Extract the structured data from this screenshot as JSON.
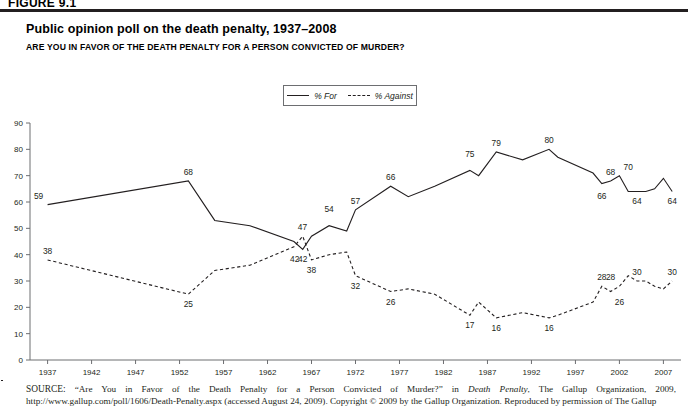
{
  "figure": {
    "label": "FIGURE 9.1",
    "title": "Public opinion poll on the death penalty, 1937–2008",
    "subtitle": "ARE YOU IN FAVOR OF THE DEATH PENALTY FOR A PERSON CONVICTED OF MURDER?"
  },
  "legend": {
    "for_label": "% For",
    "against_label": "% Against",
    "for_style": "solid-line",
    "against_style": "dashed-line"
  },
  "source": {
    "kicker": "SOURCE:",
    "text_part1": " “Are You in Favor of the Death Penalty for a Person Convicted of Murder?” in ",
    "italic1": "Death Penalty",
    "text_part2": ", The Gallup Organization, 2009, http://www.gallup.com/poll/1606/Death-Penalty.aspx (accessed August 24, 2009). Copyright © 2009 by the Gallup Organization. Reproduced by permission of The Gallup"
  },
  "colors": {
    "ink": "#231f20",
    "axis": "#6d6e71",
    "background": "#ffffff"
  },
  "chart_data": {
    "type": "line",
    "title": "Public opinion poll on the death penalty, 1937–2008",
    "subtitle": "ARE YOU IN FAVOR OF THE DEATH PENALTY FOR A PERSON CONVICTED OF MURDER?",
    "xlabel": "",
    "ylabel": "",
    "xlim": [
      1935,
      2009
    ],
    "ylim": [
      0,
      90
    ],
    "ytick_step": 10,
    "yticks": [
      0,
      10,
      20,
      30,
      40,
      50,
      60,
      70,
      80,
      90
    ],
    "xticks": [
      1937,
      1942,
      1947,
      1952,
      1957,
      1962,
      1967,
      1972,
      1977,
      1982,
      1987,
      1992,
      1997,
      2002,
      2007
    ],
    "grid": false,
    "legend_position": "top-center",
    "series": [
      {
        "name": "% For",
        "style": "solid",
        "x": [
          1937,
          1953,
          1956,
          1960,
          1965,
          1966,
          1967,
          1969,
          1971,
          1972,
          1976,
          1978,
          1981,
          1985,
          1986,
          1988,
          1991,
          1994,
          1995,
          1999,
          2000,
          2001,
          2002,
          2003,
          2004,
          2005,
          2006,
          2007,
          2008
        ],
        "values": [
          59,
          68,
          53,
          51,
          45,
          42,
          47,
          51,
          49,
          57,
          66,
          62,
          66,
          72,
          70,
          79,
          76,
          80,
          77,
          71,
          67,
          68,
          70,
          64,
          64,
          64,
          65,
          69,
          64
        ],
        "labels": [
          {
            "x": 1937,
            "value": 59,
            "pos": "above-left"
          },
          {
            "x": 1953,
            "value": 68,
            "pos": "above"
          },
          {
            "x": 1967,
            "value": 47,
            "pos": "above-left"
          },
          {
            "x": 1966,
            "value": 42,
            "pos": "below"
          },
          {
            "x": 1969,
            "value": 54,
            "pos": "above"
          },
          {
            "x": 1972,
            "value": 57,
            "pos": "above"
          },
          {
            "x": 1976,
            "value": 66,
            "pos": "above"
          },
          {
            "x": 1985,
            "value": 75,
            "pos": "above"
          },
          {
            "x": 1988,
            "value": 79,
            "pos": "above"
          },
          {
            "x": 1994,
            "value": 80,
            "pos": "above"
          },
          {
            "x": 2001,
            "value": 68,
            "pos": "above"
          },
          {
            "x": 2000,
            "value": 66,
            "pos": "below"
          },
          {
            "x": 2003,
            "value": 70,
            "pos": "above"
          },
          {
            "x": 2004,
            "value": 64,
            "pos": "below"
          },
          {
            "x": 2008,
            "value": 64,
            "pos": "below"
          }
        ]
      },
      {
        "name": "% Against",
        "style": "dashed",
        "x": [
          1937,
          1953,
          1956,
          1960,
          1965,
          1966,
          1967,
          1969,
          1971,
          1972,
          1976,
          1978,
          1981,
          1985,
          1986,
          1988,
          1991,
          1994,
          1995,
          1999,
          2000,
          2001,
          2002,
          2003,
          2004,
          2005,
          2006,
          2007,
          2008
        ],
        "values": [
          38,
          25,
          34,
          36,
          43,
          47,
          38,
          40,
          41,
          32,
          26,
          27,
          25,
          17,
          22,
          16,
          18,
          16,
          17,
          22,
          28,
          26,
          28,
          32,
          30,
          30,
          28,
          27,
          30
        ],
        "labels": [
          {
            "x": 1937,
            "value": 38,
            "pos": "above"
          },
          {
            "x": 1953,
            "value": 25,
            "pos": "below"
          },
          {
            "x": 1966,
            "value": 42,
            "pos": "below-left"
          },
          {
            "x": 1967,
            "value": 38,
            "pos": "below"
          },
          {
            "x": 1972,
            "value": 32,
            "pos": "below"
          },
          {
            "x": 1976,
            "value": 26,
            "pos": "below"
          },
          {
            "x": 1985,
            "value": 17,
            "pos": "below"
          },
          {
            "x": 1988,
            "value": 16,
            "pos": "below"
          },
          {
            "x": 1994,
            "value": 16,
            "pos": "below"
          },
          {
            "x": 2000,
            "value": 28,
            "pos": "above"
          },
          {
            "x": 2001,
            "value": 28,
            "pos": "above"
          },
          {
            "x": 2002,
            "value": 26,
            "pos": "below"
          },
          {
            "x": 2004,
            "value": 30,
            "pos": "above"
          },
          {
            "x": 2008,
            "value": 30,
            "pos": "above"
          }
        ]
      }
    ]
  }
}
